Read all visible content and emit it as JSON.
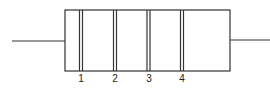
{
  "diagram": {
    "component": "resistor",
    "bands": [
      {
        "label": "1",
        "x": 81
      },
      {
        "label": "2",
        "x": 115
      },
      {
        "label": "3",
        "x": 148
      },
      {
        "label": "4",
        "x": 182
      }
    ],
    "colors": {
      "stroke": "#333333",
      "background": "#ffffff"
    }
  }
}
